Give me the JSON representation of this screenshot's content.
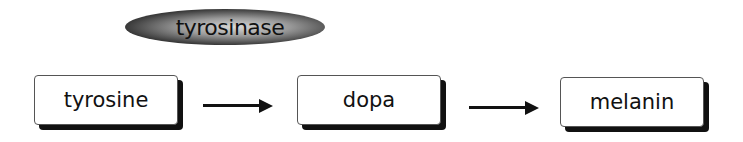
{
  "enzyme": {
    "label": "tyrosinase"
  },
  "nodes": [
    {
      "label": "tyrosine"
    },
    {
      "label": "dopa"
    },
    {
      "label": "melanin"
    }
  ],
  "arrows": [
    {
      "from": "tyrosine",
      "to": "dopa"
    },
    {
      "from": "dopa",
      "to": "melanin"
    }
  ],
  "colors": {
    "ink": "#111111",
    "box_fill": "#ffffff"
  }
}
